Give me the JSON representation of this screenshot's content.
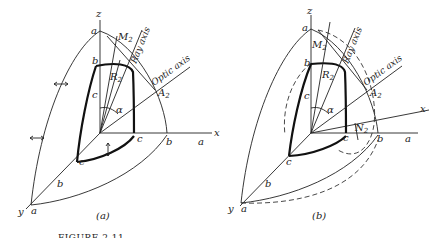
{
  "figure": {
    "caption": "FIGURE 2.11",
    "panels": [
      {
        "id": "a",
        "sublabel": "(a)",
        "axes": {
          "x": "x",
          "y": "y",
          "z": "z"
        },
        "points": {
          "M": "M",
          "M_sub": "2",
          "R": "R",
          "R_sub": "2",
          "A": "A",
          "A_sub": "2"
        },
        "labels": {
          "ray_axis": "Ray axis",
          "optic_axis": "Optic axis",
          "alpha": "α"
        },
        "ticks": {
          "a_z": "a",
          "b_z": "b",
          "c_z": "c",
          "c_x": "c",
          "b_x": "b",
          "a_x": "a",
          "c_y": "c",
          "b_y": "b",
          "a_y": "a"
        }
      },
      {
        "id": "b",
        "sublabel": "(b)",
        "axes": {
          "x": "x",
          "y": "y",
          "z": "z"
        },
        "points": {
          "M": "M",
          "M_sub": "2",
          "R": "R",
          "R_sub": "2",
          "A": "A",
          "A_sub": "2",
          "N": "N",
          "N_sub": "2"
        },
        "labels": {
          "ray_axis": "Ray axis",
          "optic_axis": "Optic axis",
          "alpha": "α"
        },
        "ticks": {
          "a_z": "a",
          "b_z": "b",
          "c_z": "c",
          "c_x": "c",
          "b_x": "b",
          "a_x": "a",
          "c_y": "c",
          "b_y": "b",
          "a_y": "a"
        }
      }
    ]
  }
}
